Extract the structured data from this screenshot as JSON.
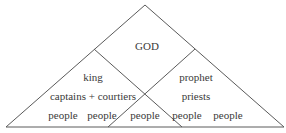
{
  "diagram": {
    "type": "hierarchy-triangle",
    "line_color": "#5a5a5a",
    "text_color": "#3a3a3a",
    "apex": {
      "label": "GOD"
    },
    "left_branch": {
      "top": "king",
      "middle": "captains + courtiers"
    },
    "right_branch": {
      "top": "prophet",
      "middle": "priests"
    },
    "base_row": [
      {
        "label": "people"
      },
      {
        "label": "people"
      },
      {
        "label": "people"
      },
      {
        "label": "people"
      },
      {
        "label": "people"
      }
    ]
  }
}
